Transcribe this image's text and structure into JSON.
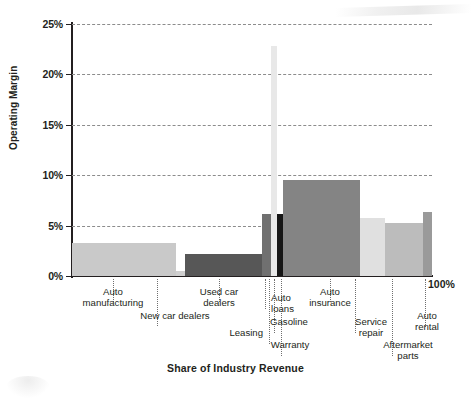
{
  "chart_data": {
    "type": "bar",
    "title": "Share of Industry Revenue",
    "xlabel": "Share of Industry Revenue",
    "ylabel": "Operating Margin",
    "ylim": [
      0,
      25
    ],
    "ytick_labels": [
      "0%",
      "5%",
      "10%",
      "15%",
      "20%",
      "25%"
    ],
    "ytick_values": [
      0,
      5,
      10,
      15,
      20,
      25
    ],
    "xlim": [
      0,
      100
    ],
    "x_end_label": "100%",
    "grid": "horizontal-dashed",
    "legend": "none",
    "note": "Marimekko / variable-width bar chart: bar width = share of industry revenue (%), bar height = operating margin (%)",
    "categories": [
      {
        "label": "Auto\nmanufacturing",
        "operating_margin": 3.3,
        "share_start": 0.0,
        "share_end": 29.0,
        "color": "#c9c9c9"
      },
      {
        "label": "New car dealers",
        "operating_margin": 0.5,
        "share_start": 29.0,
        "share_end": 31.5,
        "color": "#cfcfcf"
      },
      {
        "label": "Used car\ndealers",
        "operating_margin": 2.2,
        "share_start": 31.5,
        "share_end": 52.5,
        "color": "#575757"
      },
      {
        "label": "Auto\nloans",
        "operating_margin": 2.2,
        "share_start": 52.5,
        "share_end": 52.8,
        "color": "#575757"
      },
      {
        "label": "Leasing",
        "operating_margin": 6.2,
        "share_start": 52.8,
        "share_end": 55.3,
        "color": "#707070"
      },
      {
        "label": "Gasoline",
        "operating_margin": 22.8,
        "share_start": 55.3,
        "share_end": 57.0,
        "color": "#e8e8e8"
      },
      {
        "label": "Warranty",
        "operating_margin": 6.2,
        "share_start": 57.0,
        "share_end": 58.7,
        "color": "#161616"
      },
      {
        "label": "Auto\ninsurance",
        "operating_margin": 9.5,
        "share_start": 58.7,
        "share_end": 80.0,
        "color": "#848484"
      },
      {
        "label": "Service\nrepair",
        "operating_margin": 5.8,
        "share_start": 80.0,
        "share_end": 87.0,
        "color": "#e0e0e0"
      },
      {
        "label": "Aftermarket\nparts",
        "operating_margin": 5.3,
        "share_start": 87.0,
        "share_end": 97.5,
        "color": "#bcbcbc"
      },
      {
        "label": "Auto\nrental",
        "operating_margin": 6.4,
        "share_start": 97.5,
        "share_end": 100.0,
        "color": "#9a9a9a"
      }
    ]
  }
}
